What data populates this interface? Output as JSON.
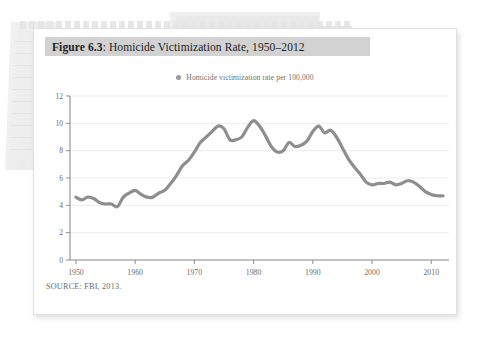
{
  "figure": {
    "label": "Figure 6.3",
    "separator": ":",
    "title": "Homicide Victimization Rate, 1950–2012",
    "source_note": "SOURCE: FBI, 2013."
  },
  "legend": {
    "marker": "legend-dot-icon",
    "label": "Homicide victimization rate per 100,000",
    "color": "#9a9a9a"
  },
  "colors": {
    "line": "#8e8e8e",
    "grid": "#ececec",
    "axis": "#8d8d8d",
    "title_band": "#d2d2d2",
    "card_background": "#ffffff",
    "page_background": "#ffffff"
  },
  "chart_data": {
    "type": "line",
    "title": "Homicide Victimization Rate, 1950–2012",
    "xlabel": "",
    "ylabel": "",
    "xlim": [
      1949,
      2013
    ],
    "ylim": [
      0,
      12
    ],
    "grid": true,
    "legend_position": "top-center",
    "ytick_labels": [
      "0",
      "2",
      "4",
      "6",
      "8",
      "10",
      "12"
    ],
    "yticks": [
      0,
      2,
      4,
      6,
      8,
      10,
      12
    ],
    "xtick_labels": [
      "1950",
      "1960",
      "1970",
      "1980",
      "1990",
      "2000",
      "2010"
    ],
    "xticks": [
      1950,
      1960,
      1970,
      1980,
      1990,
      2000,
      2010
    ],
    "series": [
      {
        "name": "Homicide victimization rate per 100,000",
        "x": [
          1950,
          1951,
          1952,
          1953,
          1954,
          1955,
          1956,
          1957,
          1958,
          1959,
          1960,
          1961,
          1962,
          1963,
          1964,
          1965,
          1966,
          1967,
          1968,
          1969,
          1970,
          1971,
          1972,
          1973,
          1974,
          1975,
          1976,
          1977,
          1978,
          1979,
          1980,
          1981,
          1982,
          1983,
          1984,
          1985,
          1986,
          1987,
          1988,
          1989,
          1990,
          1991,
          1992,
          1993,
          1994,
          1995,
          1996,
          1997,
          1998,
          1999,
          2000,
          2001,
          2002,
          2003,
          2004,
          2005,
          2006,
          2007,
          2008,
          2009,
          2010,
          2011,
          2012
        ],
        "values": [
          4.6,
          4.4,
          4.6,
          4.5,
          4.2,
          4.1,
          4.1,
          3.9,
          4.6,
          4.9,
          5.1,
          4.8,
          4.6,
          4.6,
          4.9,
          5.1,
          5.6,
          6.2,
          6.9,
          7.3,
          7.9,
          8.6,
          9.0,
          9.4,
          9.8,
          9.6,
          8.8,
          8.8,
          9.0,
          9.7,
          10.2,
          9.8,
          9.1,
          8.3,
          7.9,
          8.0,
          8.6,
          8.3,
          8.4,
          8.7,
          9.4,
          9.8,
          9.3,
          9.5,
          9.0,
          8.2,
          7.4,
          6.8,
          6.3,
          5.7,
          5.5,
          5.6,
          5.6,
          5.7,
          5.5,
          5.6,
          5.8,
          5.7,
          5.4,
          5.0,
          4.8,
          4.7,
          4.7
        ]
      }
    ]
  }
}
